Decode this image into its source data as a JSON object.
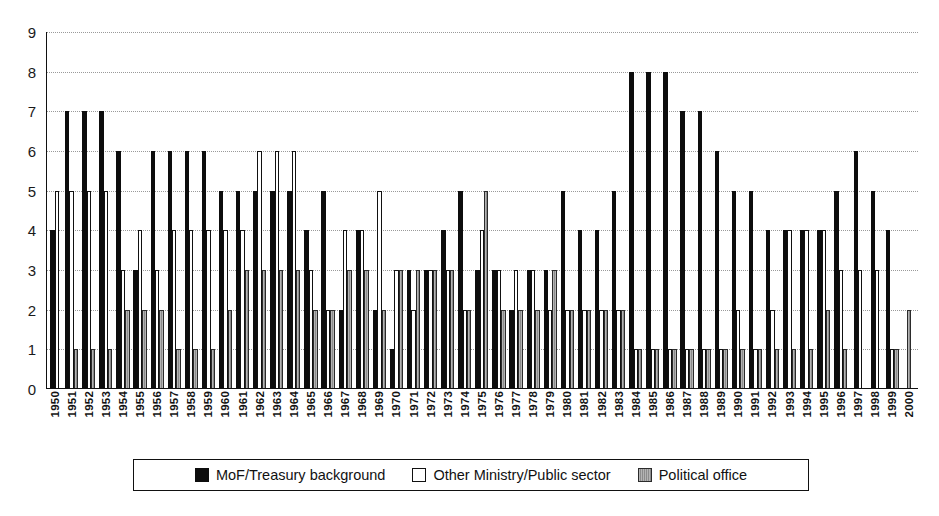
{
  "chart_data": {
    "type": "bar",
    "title": "",
    "subtitle": "",
    "xlabel": "",
    "ylabel": "",
    "ylim": [
      0,
      9
    ],
    "y_ticks": [
      0,
      1,
      2,
      3,
      4,
      5,
      6,
      7,
      8,
      9
    ],
    "grid": true,
    "legend_position": "bottom",
    "categories": [
      "1950",
      "1951",
      "1952",
      "1953",
      "1954",
      "1955",
      "1956",
      "1957",
      "1958",
      "1959",
      "1960",
      "1961",
      "1962",
      "1963",
      "1964",
      "1965",
      "1966",
      "1967",
      "1968",
      "1969",
      "1970",
      "1971",
      "1972",
      "1973",
      "1974",
      "1975",
      "1976",
      "1977",
      "1978",
      "1979",
      "1980",
      "1981",
      "1982",
      "1983",
      "1984",
      "1985",
      "1986",
      "1987",
      "1988",
      "1989",
      "1990",
      "1991",
      "1992",
      "1993",
      "1994",
      "1995",
      "1996",
      "1997",
      "1998",
      "1999",
      "2000"
    ],
    "series": [
      {
        "name": "MoF/Treasury background",
        "color": "#0d0d0d",
        "values": [
          4,
          7,
          7,
          7,
          6,
          3,
          6,
          6,
          6,
          6,
          5,
          5,
          5,
          5,
          5,
          4,
          5,
          2,
          4,
          2,
          1,
          3,
          3,
          4,
          5,
          3,
          3,
          2,
          3,
          3,
          5,
          4,
          4,
          5,
          8,
          8,
          8,
          7,
          7,
          6,
          5,
          5,
          4,
          4,
          4,
          4,
          5,
          6,
          5,
          4,
          0
        ]
      },
      {
        "name": "Other Ministry/Public sector",
        "color": "#ffffff",
        "values": [
          5,
          5,
          5,
          5,
          3,
          4,
          3,
          4,
          4,
          4,
          4,
          4,
          6,
          6,
          6,
          3,
          2,
          4,
          4,
          5,
          3,
          2,
          3,
          3,
          2,
          4,
          3,
          3,
          3,
          2,
          2,
          2,
          2,
          2,
          1,
          1,
          1,
          1,
          1,
          1,
          2,
          1,
          2,
          4,
          4,
          4,
          3,
          3,
          3,
          1,
          0
        ]
      },
      {
        "name": "Political office",
        "color": "#8c8c8c",
        "values": [
          0,
          1,
          1,
          1,
          2,
          2,
          2,
          1,
          1,
          1,
          2,
          3,
          3,
          3,
          3,
          2,
          2,
          3,
          3,
          2,
          3,
          3,
          3,
          3,
          2,
          5,
          2,
          2,
          2,
          3,
          2,
          2,
          2,
          2,
          1,
          1,
          1,
          1,
          1,
          1,
          1,
          1,
          1,
          1,
          1,
          2,
          1,
          0,
          0,
          1,
          2
        ]
      }
    ]
  },
  "legend": {
    "items": [
      {
        "label": "MoF/Treasury background",
        "swatch": "black-square-icon"
      },
      {
        "label": "Other Ministry/Public sector",
        "swatch": "white-square-icon"
      },
      {
        "label": "Political office",
        "swatch": "gray-square-icon"
      }
    ]
  },
  "caption": {
    "text": ""
  }
}
